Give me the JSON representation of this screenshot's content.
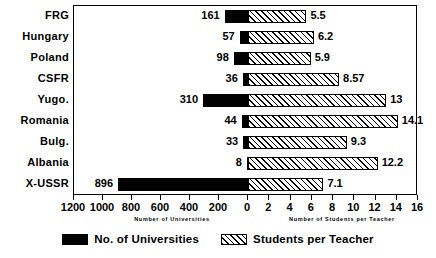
{
  "chart_data": {
    "type": "bar",
    "orientation": "horizontal",
    "style": "back-to-back diverging bars",
    "title": "",
    "categories": [
      "FRG",
      "Hungary",
      "Poland",
      "CSFR",
      "Yugo.",
      "Romania",
      "Bulg.",
      "Albania",
      "X-USSR"
    ],
    "series": [
      {
        "name": "No. of Universities",
        "direction": "left",
        "fill": "solid-black",
        "values": [
          161,
          57,
          98,
          36,
          310,
          44,
          33,
          8,
          896
        ],
        "labels": [
          "161",
          "57",
          "98",
          "36",
          "310",
          "44",
          "33",
          "8",
          "896"
        ],
        "axis": {
          "label": "Number of Universities",
          "ticks": [
            1200,
            1000,
            800,
            600,
            400,
            200,
            0
          ],
          "tick_labels": [
            "1200",
            "1000",
            "800",
            "600",
            "400",
            "200",
            "0"
          ],
          "range": [
            1200,
            0
          ],
          "reversed": true
        }
      },
      {
        "name": "Students per Teacher",
        "direction": "right",
        "fill": "diagonal-hatch",
        "values": [
          5.5,
          6.2,
          5.9,
          8.57,
          13,
          14.1,
          9.3,
          12.2,
          7.1
        ],
        "labels": [
          "5.5",
          "6.2",
          "5.9",
          "8.57",
          "13",
          "14.1",
          "9.3",
          "12.2",
          "7.1"
        ],
        "axis": {
          "label": "Number of Students per Teacher",
          "ticks": [
            0,
            2,
            4,
            6,
            8,
            10,
            12,
            14,
            16
          ],
          "tick_labels": [
            "0",
            "2",
            "4",
            "6",
            "8",
            "10",
            "12",
            "14",
            "16"
          ],
          "range": [
            0,
            16
          ],
          "reversed": false
        }
      }
    ],
    "legend": {
      "position": "bottom",
      "entries": [
        {
          "label": "No. of Universities",
          "swatch": "solid-black"
        },
        {
          "label": "Students per Teacher",
          "swatch": "diagonal-hatch"
        }
      ]
    },
    "grid": false,
    "frame": true
  },
  "colors": {
    "ink": "#000000",
    "background": "#ffffff"
  }
}
